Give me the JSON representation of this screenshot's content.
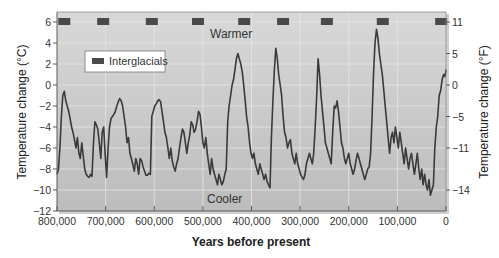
{
  "chart_data": {
    "type": "line",
    "title": "",
    "xlabel": "Years before present",
    "ylabel": "Temperature change (°C)",
    "ylabel_right": "Temperature change (°F)",
    "xlim": [
      800000,
      0
    ],
    "ylim": [
      -12,
      7
    ],
    "grid": true,
    "x_ticks": [
      800000,
      700000,
      600000,
      500000,
      400000,
      300000,
      200000,
      100000,
      0
    ],
    "x_tick_labels": [
      "800,000",
      "700,000",
      "600,000",
      "500,000",
      "400,000",
      "300,000",
      "200,000",
      "100,000",
      "0"
    ],
    "y_ticks": [
      6,
      4,
      2,
      0,
      -2,
      -4,
      -6,
      -8,
      -10,
      -12
    ],
    "y_tick_labels": [
      "6",
      "4",
      "2",
      "0",
      "−2",
      "−4",
      "−6",
      "−8",
      "−10",
      "−12"
    ],
    "y_right_ticks": [
      {
        "label": "11",
        "c": 6
      },
      {
        "label": "5",
        "c": 3
      },
      {
        "label": "0",
        "c": 0
      },
      {
        "label": "−5",
        "c": -3
      },
      {
        "label": "−11",
        "c": -6
      },
      {
        "label": "−14",
        "c": -10
      }
    ],
    "annotations": [
      {
        "text": "Warmer",
        "x": 400000,
        "y": 4.8
      },
      {
        "text": "Cooler",
        "x": 400000,
        "y": -10.6
      }
    ],
    "legend": {
      "entries": [
        "Interglacials"
      ],
      "position": "upper-left"
    },
    "interglacials": [
      785000,
      705000,
      605000,
      510000,
      415000,
      335000,
      245000,
      130000,
      10000
    ],
    "series": [
      {
        "name": "Temperature change",
        "color": "#3a3a3a",
        "x": [
          800000,
          797000,
          794000,
          791000,
          788000,
          785000,
          782000,
          779000,
          776000,
          773000,
          770000,
          767000,
          764000,
          761000,
          758000,
          755000,
          752000,
          749000,
          746000,
          743000,
          740000,
          737000,
          734000,
          731000,
          728000,
          725000,
          722000,
          719000,
          716000,
          713000,
          710000,
          707000,
          704000,
          701000,
          698000,
          695000,
          692000,
          689000,
          686000,
          683000,
          680000,
          677000,
          674000,
          671000,
          668000,
          665000,
          662000,
          659000,
          656000,
          653000,
          650000,
          647000,
          644000,
          641000,
          638000,
          635000,
          632000,
          629000,
          626000,
          623000,
          620000,
          617000,
          614000,
          611000,
          608000,
          605000,
          602000,
          599000,
          596000,
          593000,
          590000,
          587000,
          584000,
          581000,
          578000,
          575000,
          572000,
          569000,
          566000,
          563000,
          560000,
          557000,
          554000,
          551000,
          548000,
          545000,
          542000,
          539000,
          536000,
          533000,
          530000,
          527000,
          524000,
          521000,
          518000,
          515000,
          512000,
          509000,
          506000,
          503000,
          500000,
          497000,
          494000,
          491000,
          488000,
          485000,
          482000,
          479000,
          476000,
          473000,
          470000,
          467000,
          464000,
          461000,
          458000,
          455000,
          452000,
          449000,
          446000,
          443000,
          440000,
          437000,
          434000,
          431000,
          428000,
          425000,
          422000,
          419000,
          416000,
          413000,
          410000,
          407000,
          404000,
          401000,
          398000,
          395000,
          392000,
          389000,
          386000,
          383000,
          380000,
          377000,
          374000,
          371000,
          368000,
          365000,
          362000,
          359000,
          356000,
          353000,
          350000,
          347000,
          344000,
          341000,
          338000,
          335000,
          332000,
          329000,
          326000,
          323000,
          320000,
          317000,
          314000,
          311000,
          308000,
          305000,
          302000,
          299000,
          296000,
          293000,
          290000,
          287000,
          284000,
          281000,
          278000,
          275000,
          272000,
          269000,
          266000,
          263000,
          260000,
          257000,
          254000,
          251000,
          248000,
          245000,
          242000,
          239000,
          236000,
          233000,
          230000,
          227000,
          224000,
          221000,
          218000,
          215000,
          212000,
          209000,
          206000,
          203000,
          200000,
          197000,
          194000,
          191000,
          188000,
          185000,
          182000,
          179000,
          176000,
          173000,
          170000,
          167000,
          164000,
          161000,
          158000,
          155000,
          152000,
          149000,
          146000,
          143000,
          140000,
          137000,
          134000,
          131000,
          128000,
          125000,
          122000,
          119000,
          116000,
          113000,
          110000,
          107000,
          104000,
          101000,
          98000,
          95000,
          92000,
          89000,
          86000,
          83000,
          80000,
          77000,
          74000,
          71000,
          68000,
          65000,
          62000,
          59000,
          56000,
          53000,
          50000,
          47000,
          44000,
          41000,
          38000,
          35000,
          32000,
          29000,
          26000,
          23000,
          20000,
          17000,
          14000,
          11000,
          8000,
          5000,
          2000,
          0
        ],
        "values": [
          -8.5,
          -8.0,
          -6.0,
          -3.0,
          -1.0,
          -0.6,
          -1.5,
          -2.0,
          -2.5,
          -3.2,
          -4.0,
          -4.5,
          -5.2,
          -6.0,
          -5.0,
          -6.5,
          -7.0,
          -5.5,
          -6.8,
          -8.0,
          -8.5,
          -8.7,
          -8.8,
          -8.5,
          -8.7,
          -5.5,
          -3.5,
          -3.8,
          -4.2,
          -5.5,
          -7.0,
          -4.5,
          -4.0,
          -6.5,
          -8.8,
          -6.0,
          -4.0,
          -3.2,
          -3.0,
          -2.8,
          -2.5,
          -2.0,
          -1.6,
          -1.3,
          -1.5,
          -2.0,
          -3.0,
          -4.0,
          -5.5,
          -5.0,
          -6.5,
          -7.0,
          -7.6,
          -8.2,
          -7.0,
          -7.5,
          -8.5,
          -7.0,
          -7.2,
          -7.8,
          -8.2,
          -8.6,
          -8.6,
          -8.4,
          -8.5,
          -3.0,
          -2.5,
          -2.0,
          -1.8,
          -1.5,
          -1.4,
          -1.6,
          -2.5,
          -3.5,
          -4.5,
          -5.0,
          -6.0,
          -7.0,
          -6.0,
          -7.2,
          -7.8,
          -8.2,
          -7.5,
          -7.0,
          -6.0,
          -5.0,
          -4.2,
          -4.5,
          -5.5,
          -6.5,
          -5.5,
          -4.8,
          -3.5,
          -3.8,
          -4.5,
          -4.2,
          -3.5,
          -2.5,
          -2.8,
          -4.0,
          -5.5,
          -6.0,
          -5.0,
          -6.5,
          -7.5,
          -8.5,
          -7.0,
          -8.0,
          -8.5,
          -9.0,
          -9.5,
          -8.5,
          -9.0,
          -9.5,
          -9.2,
          -8.5,
          -8.0,
          -3.5,
          -2.0,
          -1.0,
          0.0,
          0.5,
          1.5,
          2.5,
          3.0,
          2.5,
          2.0,
          1.2,
          0.0,
          -1.5,
          -3.0,
          -4.0,
          -5.5,
          -6.5,
          -7.0,
          -6.5,
          -7.5,
          -8.0,
          -8.5,
          -7.5,
          -8.0,
          -8.5,
          -9.0,
          -8.5,
          -9.2,
          -9.5,
          -9.8,
          -5.0,
          -1.5,
          1.5,
          3.5,
          2.5,
          1.0,
          0.0,
          -1.0,
          -3.0,
          -4.5,
          -5.0,
          -6.0,
          -5.5,
          -5.2,
          -6.5,
          -7.0,
          -7.5,
          -6.5,
          -7.5,
          -8.0,
          -8.5,
          -8.8,
          -9.0,
          -8.5,
          -7.5,
          -7.0,
          -6.5,
          -7.0,
          -7.5,
          -6.5,
          -4.0,
          -1.0,
          2.5,
          1.0,
          -1.0,
          -2.5,
          -4.0,
          -5.5,
          -6.0,
          -6.5,
          -7.0,
          -7.5,
          -4.5,
          -2.0,
          -2.2,
          -1.5,
          -2.5,
          -4.0,
          -5.5,
          -6.0,
          -7.0,
          -7.5,
          -7.0,
          -6.5,
          -7.5,
          -8.0,
          -8.5,
          -8.0,
          -7.2,
          -6.5,
          -7.0,
          -7.5,
          -8.0,
          -8.5,
          -9.0,
          -8.5,
          -8.0,
          -7.8,
          -6.5,
          -3.0,
          1.0,
          4.0,
          5.3,
          4.5,
          3.0,
          2.0,
          1.0,
          -0.5,
          -2.0,
          -3.5,
          -5.0,
          -6.5,
          -5.0,
          -4.5,
          -5.5,
          -4.0,
          -5.0,
          -6.0,
          -4.5,
          -5.5,
          -6.5,
          -7.5,
          -6.0,
          -7.0,
          -8.0,
          -7.0,
          -6.5,
          -7.5,
          -8.5,
          -7.5,
          -6.5,
          -8.0,
          -9.0,
          -8.0,
          -9.5,
          -8.5,
          -9.5,
          -10.0,
          -9.0,
          -10.5,
          -10.0,
          -9.5,
          -6.0,
          -4.0,
          -3.0,
          -1.0,
          -0.5,
          0.5,
          1.0,
          0.8,
          1.5
        ]
      }
    ]
  },
  "labels": {
    "legend_label": "Interglacials",
    "warmer": "Warmer",
    "cooler": "Cooler",
    "xlabel": "Years before present",
    "ylabel_left": "Temperature change (°C)",
    "ylabel_right": "Temperature change (°F)"
  },
  "colors": {
    "curve": "#3a3a3a",
    "interglacial_marker": "#4a4a4a",
    "plot_top": "#d6d6d6",
    "plot_bottom": "#bdbdbd",
    "grid": "#e8e8e8",
    "frame": "#5a5a5a"
  }
}
